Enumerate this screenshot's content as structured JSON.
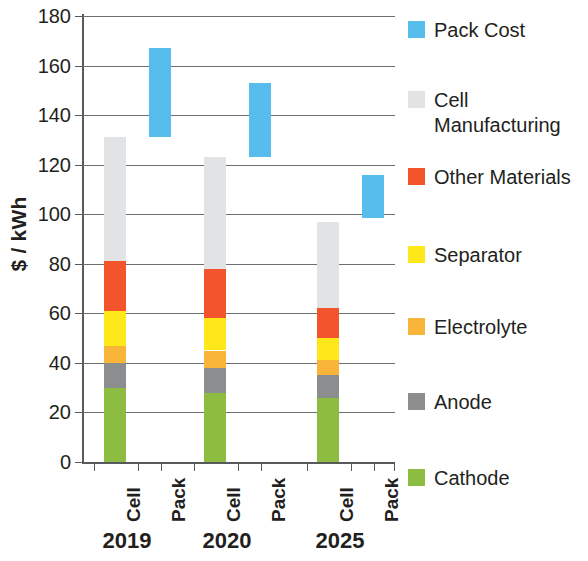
{
  "chart_data": {
    "type": "bar",
    "title": "",
    "subtitle": "",
    "xlabel": "",
    "ylabel": "$ / kWh",
    "ylim": [
      0,
      180
    ],
    "ytick_step": 20,
    "yticks": [
      180,
      160,
      140,
      120,
      100,
      80,
      60,
      40,
      20,
      0
    ],
    "grid": true,
    "legend_position": "right",
    "stacked": true,
    "groups": [
      "2019",
      "2020",
      "2025"
    ],
    "bar_labels": [
      "Cell",
      "Pack"
    ],
    "categories": [
      "2019 Cell",
      "2019 Pack",
      "2020 Cell",
      "2020 Pack",
      "2025 Cell",
      "2025 Pack"
    ],
    "series": [
      {
        "name": "Pack Cost",
        "color": "#56bdec",
        "kind": "floating",
        "values": [
          null,
          {
            "bottom": 131,
            "top": 167
          },
          null,
          {
            "bottom": 123,
            "top": 153
          },
          null,
          {
            "bottom": 98.5,
            "top": 116
          }
        ]
      },
      {
        "name": "Cell Manufacturing",
        "color": "#e2e3e4",
        "kind": "stacked",
        "values": [
          50,
          null,
          45,
          null,
          35,
          null
        ]
      },
      {
        "name": "Other Materials",
        "color": "#f4542b",
        "kind": "stacked",
        "values": [
          20,
          null,
          20,
          null,
          12,
          null
        ]
      },
      {
        "name": "Separator",
        "color": "#ffe81a",
        "kind": "stacked",
        "values": [
          14,
          null,
          13,
          null,
          9,
          null
        ]
      },
      {
        "name": "Electrolyte",
        "color": "#f8b53a",
        "kind": "stacked",
        "values": [
          7,
          null,
          7,
          null,
          6,
          null
        ]
      },
      {
        "name": "Anode",
        "color": "#8b8d8f",
        "kind": "stacked",
        "values": [
          10,
          null,
          10,
          null,
          9,
          null
        ]
      },
      {
        "name": "Cathode",
        "color": "#8cbd40",
        "kind": "stacked",
        "values": [
          30,
          null,
          28,
          null,
          26,
          null
        ]
      }
    ],
    "cell_totals": [
      131,
      123,
      97
    ],
    "pack_ranges": [
      [
        131,
        167
      ],
      [
        123,
        153
      ],
      [
        98.5,
        116
      ]
    ]
  },
  "axis": {
    "y_title": "$ / kWh",
    "tick_labels": [
      "180",
      "160",
      "140",
      "120",
      "100",
      "80",
      "60",
      "40",
      "20",
      "0"
    ],
    "x_bar_labels": [
      "Cell",
      "Pack",
      "Cell",
      "Pack",
      "Cell",
      "Pack"
    ],
    "x_group_labels": [
      "2019",
      "2020",
      "2025"
    ]
  },
  "legend": {
    "items": [
      {
        "label": "Pack Cost",
        "color": "#56bdec"
      },
      {
        "label": "Cell\nManufacturing",
        "color": "#e2e3e4"
      },
      {
        "label": "Other Materials",
        "color": "#f4542b"
      },
      {
        "label": "Separator",
        "color": "#ffe81a"
      },
      {
        "label": "Electrolyte",
        "color": "#f8b53a"
      },
      {
        "label": "Anode",
        "color": "#8b8d8f"
      },
      {
        "label": "Cathode",
        "color": "#8cbd40"
      }
    ]
  }
}
